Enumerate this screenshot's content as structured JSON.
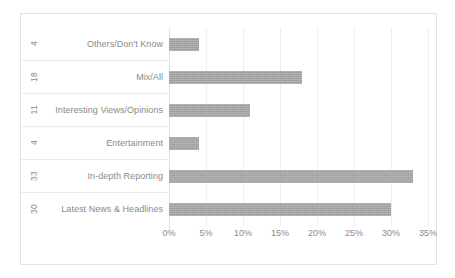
{
  "chart_data": {
    "type": "bar",
    "orientation": "horizontal",
    "title": "",
    "subtitle": "",
    "xlabel": "",
    "ylabel": "",
    "xlim": [
      0,
      35
    ],
    "grid": true,
    "legend": false,
    "categories": [
      "Others/Don't Know",
      "Mix/All",
      "Interesting Views/Opinions",
      "Entertainment",
      "In-depth Reporting",
      "Latest News & Headlines"
    ],
    "values": [
      4,
      18,
      11,
      4,
      33,
      30
    ],
    "value_labels": [
      "4",
      "18",
      "11",
      "4",
      "33",
      "30"
    ],
    "xticks": [
      0,
      5,
      10,
      15,
      20,
      25,
      30,
      35
    ],
    "xtick_labels": [
      "0%",
      "5%",
      "10%",
      "15%",
      "20%",
      "25%",
      "30%",
      "35%"
    ],
    "bar_color": "#9d9d9d",
    "gridline_color": "#efefef",
    "text_color": "#8a8a8a",
    "border_color": "#e2e2e2"
  }
}
